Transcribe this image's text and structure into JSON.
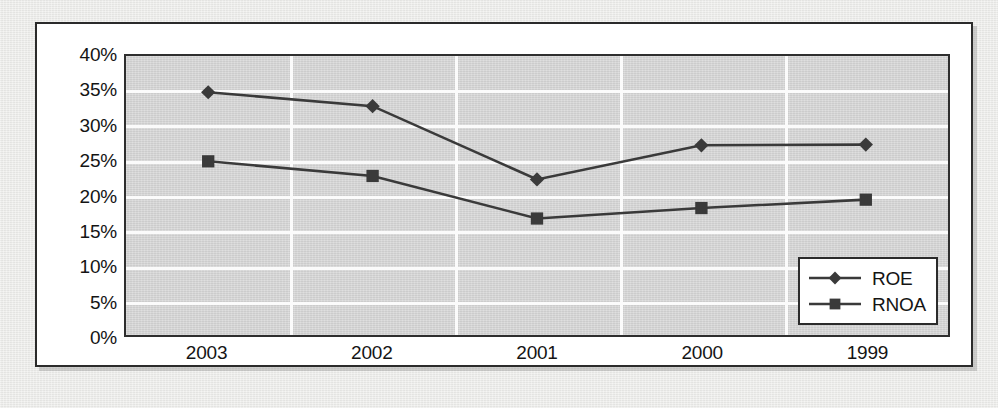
{
  "chart_data": {
    "type": "line",
    "title": "",
    "xlabel": "",
    "ylabel": "",
    "categories": [
      "2003",
      "2002",
      "2001",
      "2000",
      "1999"
    ],
    "series": [
      {
        "name": "ROE",
        "marker": "diamond",
        "color": "#3a3a3a",
        "values": [
          34.8,
          32.8,
          22.3,
          27.2,
          27.3
        ]
      },
      {
        "name": "RNOA",
        "marker": "square",
        "color": "#3a3a3a",
        "values": [
          24.9,
          22.8,
          16.7,
          18.2,
          19.4
        ]
      }
    ],
    "ylim": [
      0,
      40
    ],
    "ytick_step": 5,
    "ytick_labels": [
      "40%",
      "35%",
      "30%",
      "25%",
      "20%",
      "15%",
      "10%",
      "5%",
      "0%"
    ],
    "ytick_values": [
      40,
      35,
      30,
      25,
      20,
      15,
      10,
      5,
      0
    ],
    "grid": {
      "horizontal": true,
      "vertical": true,
      "color": "#fbfbfb"
    },
    "legend": {
      "position": "bottom-right-inside",
      "entries": [
        {
          "label": "ROE",
          "marker": "diamond"
        },
        {
          "label": "RNOA",
          "marker": "square"
        }
      ]
    },
    "plot_background": "#d3d3d3",
    "card_background": "#ffffff",
    "page_background": "#e8e8e6"
  }
}
